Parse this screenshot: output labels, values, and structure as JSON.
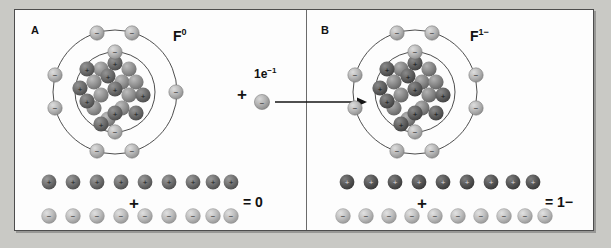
{
  "figure": {
    "background_color": "#c9c9c5",
    "panel_background": "#fdfdfd",
    "border_color": "#4d4d4d"
  },
  "colors": {
    "proton": "#6b6b6b",
    "proton_dark": "#4f4f4f",
    "neutron": "#8f8f8f",
    "electron": "#b4b4b4",
    "shell_line": "#3a3a3a",
    "text": "#111111"
  },
  "panels": [
    {
      "id": "A",
      "label": "A",
      "species_symbol": "F",
      "species_superscript": "0",
      "species_label": "F0",
      "shells": [
        {
          "name": "inner-shell",
          "radius": 40,
          "electron_count": 2
        },
        {
          "name": "outer-shell",
          "radius": 62,
          "electron_count": 7
        }
      ],
      "nucleus": {
        "proton_count": 9,
        "neutron_count": 10,
        "particle_total": 19
      },
      "tally": {
        "proton_row_count": 9,
        "proton_symbol": "+",
        "electron_row_count": 9,
        "electron_symbol": "−",
        "operator": "+",
        "result": "= 0"
      }
    },
    {
      "id": "B",
      "label": "B",
      "species_symbol": "F",
      "species_superscript": "1−",
      "species_label": "F1−",
      "shells": [
        {
          "name": "inner-shell",
          "radius": 40,
          "electron_count": 2
        },
        {
          "name": "outer-shell",
          "radius": 62,
          "electron_count": 8
        }
      ],
      "nucleus": {
        "proton_count": 9,
        "neutron_count": 10,
        "particle_total": 19
      },
      "tally": {
        "proton_row_count": 9,
        "proton_symbol": "+",
        "electron_row_count": 10,
        "electron_symbol": "−",
        "operator": "+",
        "result": "= 1−"
      }
    }
  ],
  "reaction": {
    "plus_operator": "+",
    "added_particle_label": "1e−1",
    "added_particle_symbol": "1e",
    "added_particle_superscript": "−1",
    "added_particle_charge": "−",
    "arrow_direction": "right"
  }
}
